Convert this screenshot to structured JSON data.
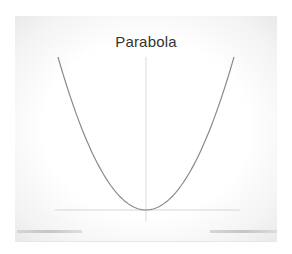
{
  "chart_data": {
    "type": "line",
    "title": "Parabola",
    "xlabel": "",
    "ylabel": "",
    "function": "y = x^2",
    "x": [
      -1.0,
      -0.75,
      -0.5,
      -0.25,
      0.0,
      0.25,
      0.5,
      0.75,
      1.0
    ],
    "series": [
      {
        "name": "y = x^2",
        "values": [
          1.0,
          0.5625,
          0.25,
          0.0625,
          0.0,
          0.0625,
          0.25,
          0.5625,
          1.0
        ]
      }
    ],
    "xlim": [
      -1.05,
      1.05
    ],
    "ylim": [
      0,
      1.0
    ],
    "axes": {
      "x_axis_at_y": 0,
      "y_axis_at_x": 0,
      "tick_labels": false
    },
    "grid": false,
    "legend": null,
    "colors": {
      "curve": "#8a8a8a",
      "axes": "#d6d6d6",
      "title": "#333333"
    }
  }
}
